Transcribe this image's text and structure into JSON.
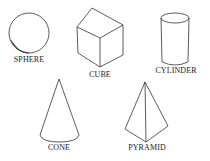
{
  "shapes": [
    {
      "id": "sphere",
      "label": "SPHERE"
    },
    {
      "id": "cube",
      "label": "CUBE"
    },
    {
      "id": "cylinder",
      "label": "CYLINDER"
    },
    {
      "id": "cone",
      "label": "CONE"
    },
    {
      "id": "pyramid",
      "label": "PYRAMID"
    }
  ],
  "colors": {
    "stroke": "#333333",
    "background": "#ffffff"
  }
}
